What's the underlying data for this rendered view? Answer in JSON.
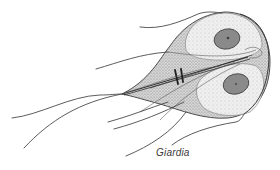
{
  "figure": {
    "subject": "Giardia",
    "caption": "Giardia",
    "style": "grayscale stippled line illustration"
  },
  "colors": {
    "outline": "#3c3c3c",
    "body_fill": "#ececec",
    "shadow_fill": "#c8c8c8",
    "nucleus_fill": "#8a8a8a",
    "nucleus_edge": "#4a4a4a",
    "flagella": "#4a4a4a",
    "caption": "#3a3a3a"
  },
  "parts": {
    "nuclei": 2,
    "flagella_pairs": 4,
    "median_bodies": 1,
    "axonemes": 1
  }
}
